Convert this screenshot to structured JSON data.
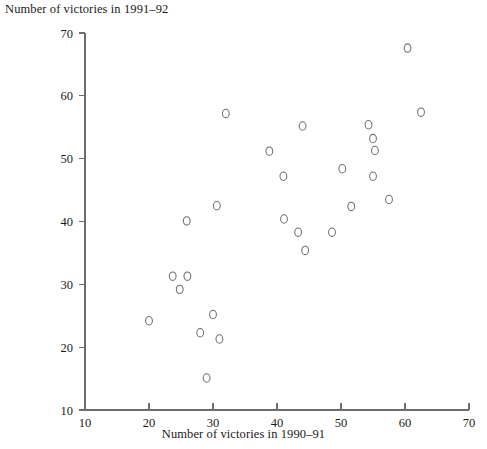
{
  "chart_data": {
    "type": "scatter",
    "title": "",
    "xlabel": "Number of victories in 1990–91",
    "ylabel": "Number of victories in 1991–92",
    "xlim": [
      10,
      70
    ],
    "ylim": [
      10,
      70
    ],
    "xticks": [
      10,
      20,
      30,
      40,
      50,
      60,
      70
    ],
    "yticks": [
      10,
      20,
      30,
      40,
      50,
      60,
      70
    ],
    "grid": false,
    "legend": null,
    "marker": "o",
    "marker_color": "#6e6e73",
    "points": [
      {
        "x": 20.0,
        "y": 24.2
      },
      {
        "x": 23.7,
        "y": 31.3
      },
      {
        "x": 26.0,
        "y": 31.3
      },
      {
        "x": 24.8,
        "y": 29.2
      },
      {
        "x": 25.9,
        "y": 40.1
      },
      {
        "x": 28.0,
        "y": 22.3
      },
      {
        "x": 29.0,
        "y": 15.1
      },
      {
        "x": 30.0,
        "y": 25.2
      },
      {
        "x": 30.6,
        "y": 42.5
      },
      {
        "x": 31.0,
        "y": 21.3
      },
      {
        "x": 32.0,
        "y": 57.2
      },
      {
        "x": 38.8,
        "y": 51.2
      },
      {
        "x": 41.0,
        "y": 47.2
      },
      {
        "x": 41.1,
        "y": 40.4
      },
      {
        "x": 43.3,
        "y": 38.3
      },
      {
        "x": 44.0,
        "y": 55.2
      },
      {
        "x": 44.4,
        "y": 35.4
      },
      {
        "x": 48.6,
        "y": 38.3
      },
      {
        "x": 50.2,
        "y": 48.4
      },
      {
        "x": 51.6,
        "y": 42.4
      },
      {
        "x": 54.3,
        "y": 55.4
      },
      {
        "x": 55.0,
        "y": 53.2
      },
      {
        "x": 55.3,
        "y": 51.3
      },
      {
        "x": 55.0,
        "y": 47.2
      },
      {
        "x": 57.5,
        "y": 43.5
      },
      {
        "x": 60.4,
        "y": 67.6
      },
      {
        "x": 62.5,
        "y": 57.4
      }
    ]
  }
}
